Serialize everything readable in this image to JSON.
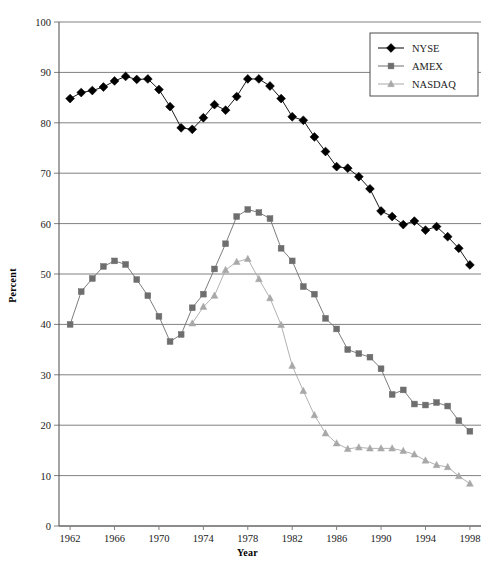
{
  "chart_data": {
    "type": "line",
    "title": "",
    "xlabel": "Year",
    "ylabel": "Percent",
    "xlim": [
      1961,
      1999
    ],
    "ylim": [
      0,
      100
    ],
    "ytick_step": 10,
    "xtick_step": 4,
    "xtick_labels": [
      "1962",
      "1966",
      "1970",
      "1974",
      "1978",
      "1982",
      "1986",
      "1990",
      "1994",
      "1998"
    ],
    "ytick_labels": [
      "0",
      "10",
      "20",
      "30",
      "40",
      "50",
      "60",
      "70",
      "80",
      "90",
      "100"
    ],
    "grid": "horizontal",
    "legend_position": "top-right",
    "x": [
      1962,
      1963,
      1964,
      1965,
      1966,
      1967,
      1968,
      1969,
      1970,
      1971,
      1972,
      1973,
      1974,
      1975,
      1976,
      1977,
      1978,
      1979,
      1980,
      1981,
      1982,
      1983,
      1984,
      1985,
      1986,
      1987,
      1988,
      1989,
      1990,
      1991,
      1992,
      1993,
      1994,
      1995,
      1996,
      1997,
      1998
    ],
    "series": [
      {
        "name": "NYSE",
        "color": "#000000",
        "marker": "diamond",
        "values": [
          84.8,
          86.0,
          86.4,
          87.1,
          88.3,
          89.2,
          88.6,
          88.7,
          86.6,
          83.2,
          79.0,
          78.7,
          81.0,
          83.6,
          82.5,
          85.2,
          88.7,
          88.7,
          87.3,
          84.8,
          81.2,
          80.5,
          77.2,
          74.3,
          71.3,
          71.0,
          69.3,
          66.9,
          62.5,
          61.4,
          59.8,
          60.5,
          58.7,
          59.4,
          57.4,
          55.1,
          51.8
        ]
      },
      {
        "name": "AMEX",
        "color": "#6e6e6e",
        "marker": "square",
        "values": [
          40.0,
          46.5,
          49.1,
          51.5,
          52.6,
          51.9,
          48.9,
          45.7,
          41.6,
          36.6,
          38.0,
          43.3,
          46.0,
          51.0,
          56.0,
          61.4,
          62.8,
          62.2,
          61.0,
          55.1,
          52.6,
          47.5,
          46.0,
          41.2,
          39.1,
          35.0,
          34.2,
          33.5,
          31.2,
          26.1,
          27.0,
          24.2,
          24.0,
          24.5,
          23.8,
          20.9,
          18.8
        ]
      },
      {
        "name": "NASDAQ",
        "color": "#a8a8a8",
        "marker": "triangle",
        "values": [
          null,
          null,
          null,
          null,
          null,
          null,
          null,
          null,
          null,
          null,
          null,
          40.2,
          43.5,
          45.7,
          50.8,
          52.4,
          53.0,
          49.0,
          45.2,
          39.9,
          31.8,
          26.8,
          22.0,
          18.4,
          16.4,
          15.3,
          15.6,
          15.4,
          15.4,
          15.4,
          14.9,
          14.2,
          13.0,
          12.1,
          11.7,
          9.9,
          8.4
        ]
      }
    ]
  }
}
